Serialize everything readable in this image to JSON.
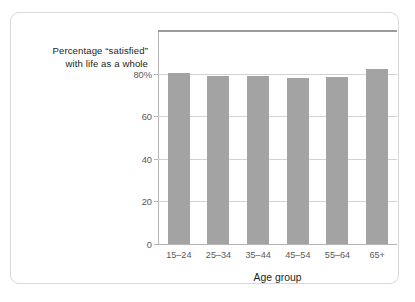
{
  "chart_data": {
    "type": "bar",
    "title": "Percentage “satisfied” with life as a whole",
    "title_lines": [
      "Percentage “satisfied”",
      "with life as a whole"
    ],
    "xlabel": "Age group",
    "ylabel": "",
    "categories": [
      "15–24",
      "25–34",
      "35–44",
      "45–54",
      "55–64",
      "65+"
    ],
    "values": [
      80.5,
      79,
      79,
      78,
      78.5,
      82
    ],
    "ylim": [
      0,
      100
    ],
    "yticks": [
      0,
      20,
      40,
      60,
      80
    ],
    "ytick_labels": [
      "0",
      "20",
      "40",
      "60",
      "80%"
    ],
    "grid": "horizontal",
    "legend": "none",
    "bar_color": "#a3a3a3",
    "grid_color": "#d2d2d2",
    "axis_color": "#b5b5b5",
    "frame_color": "#d9d9d9",
    "text_color": "#231f20",
    "tick_text_color": "#58595b"
  }
}
